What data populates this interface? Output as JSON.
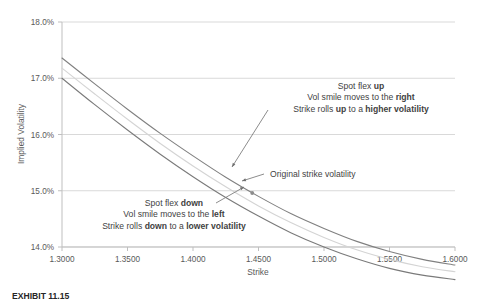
{
  "chart_data": {
    "type": "line",
    "title": "",
    "xlabel": "Strike",
    "ylabel": "Implied Volatility",
    "xlim": [
      1.3,
      1.6
    ],
    "ylim": [
      0.14,
      0.18
    ],
    "grid": true,
    "legend_position": "none",
    "x_ticks": [
      "1.3000",
      "1.3500",
      "1.4000",
      "1.4500",
      "1.5000",
      "1.5500",
      "1.6000"
    ],
    "x_tick_values": [
      1.3,
      1.35,
      1.4,
      1.45,
      1.5,
      1.55,
      1.6
    ],
    "y_ticks": [
      "14.0%",
      "15.0%",
      "16.0%",
      "17.0%",
      "18.0%"
    ],
    "y_tick_values": [
      0.14,
      0.15,
      0.16,
      0.17,
      0.18
    ],
    "x": [
      1.3,
      1.325,
      1.35,
      1.375,
      1.4,
      1.425,
      1.45,
      1.475,
      1.5,
      1.525,
      1.55,
      1.575,
      1.6
    ],
    "series": [
      {
        "name": "Vol smile shifted right (spot flex up)",
        "color": "#808080",
        "values": [
          0.1736,
          0.169,
          0.1645,
          0.1602,
          0.1562,
          0.1524,
          0.149,
          0.1459,
          0.1433,
          0.141,
          0.1392,
          0.1378,
          0.1368
        ]
      },
      {
        "name": "Original vol smile",
        "color": "#d4d4d4",
        "values": [
          0.1718,
          0.1672,
          0.1627,
          0.1584,
          0.1544,
          0.1507,
          0.1473,
          0.1443,
          0.1417,
          0.1395,
          0.1378,
          0.1365,
          0.1356
        ]
      },
      {
        "name": "Vol smile shifted left (spot flex down)",
        "color": "#7a7a7a",
        "values": [
          0.17,
          0.1653,
          0.1608,
          0.1565,
          0.1525,
          0.1488,
          0.1455,
          0.1425,
          0.14,
          0.1379,
          0.1362,
          0.135,
          0.1342
        ]
      }
    ],
    "marker": {
      "name": "original-strike-point",
      "x": 1.4452,
      "y": 0.1496
    },
    "annotations": {
      "upper": {
        "lines": [
          [
            {
              "t": "Spot flex ",
              "b": false
            },
            {
              "t": "up",
              "b": true
            }
          ],
          [
            {
              "t": "Vol smile moves to the ",
              "b": false
            },
            {
              "t": "right",
              "b": true
            }
          ],
          [
            {
              "t": "Strike rolls ",
              "b": false
            },
            {
              "t": "up",
              "b": true
            },
            {
              "t": " to a ",
              "b": false
            },
            {
              "t": "higher volatility",
              "b": true
            }
          ]
        ]
      },
      "middle": {
        "lines": [
          [
            {
              "t": "Original strike volatility",
              "b": false
            }
          ]
        ]
      },
      "lower": {
        "lines": [
          [
            {
              "t": "Spot flex ",
              "b": false
            },
            {
              "t": "down",
              "b": true
            }
          ],
          [
            {
              "t": "Vol smile moves to the ",
              "b": false
            },
            {
              "t": "left",
              "b": true
            }
          ],
          [
            {
              "t": "Strike rolls ",
              "b": false
            },
            {
              "t": "down",
              "b": true
            },
            {
              "t": " to a ",
              "b": false
            },
            {
              "t": "lower volatility",
              "b": true
            }
          ]
        ]
      }
    }
  },
  "caption": {
    "text": "EXHIBIT 11.15"
  }
}
